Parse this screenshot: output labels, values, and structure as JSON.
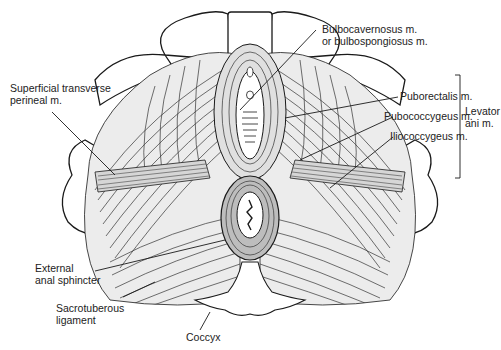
{
  "figure": {
    "labels": {
      "bulbocavernosus": {
        "line1": "Bulbocavernosus m.",
        "line2": "or bulbospongiosus m."
      },
      "superficial_transverse": {
        "line1": "Superficial transverse",
        "line2": "perineal m."
      },
      "puborectalis": "Puborectalis m.",
      "pubococcygeus": "Pubococcygeus m.",
      "iliococcygeus": "Iliococcygeus m.",
      "levator_group": {
        "line1": "Levator",
        "line2": "ani m."
      },
      "external_anal_sphincter": {
        "line1": "External",
        "line2": "anal sphincter"
      },
      "sacrotuberous": {
        "line1": "Sacrotuberous",
        "line2": "ligament"
      },
      "coccyx": "Coccyx"
    },
    "colors": {
      "ink": "#1a1a1a",
      "muscle_fill": "#e6e6e6",
      "sphincter_fill": "#bdbdbd",
      "background": "#ffffff"
    }
  }
}
